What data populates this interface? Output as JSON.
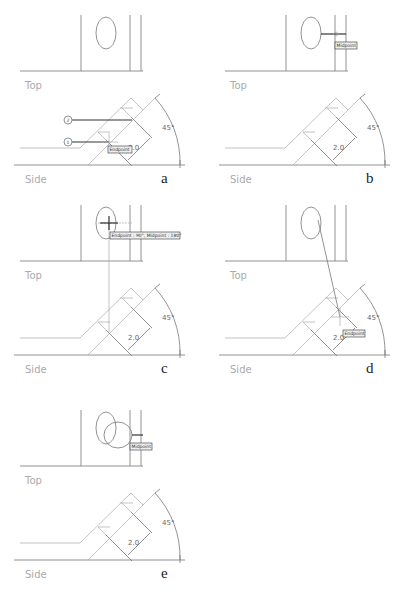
{
  "panels": [
    {
      "id": "a",
      "label": "a",
      "top_label": "Top",
      "side_label": "Side",
      "dim_length": "2.0",
      "dim_angle": "45°",
      "tooltip": "Endpoint",
      "markers": [
        "1",
        "2"
      ]
    },
    {
      "id": "b",
      "label": "b",
      "top_label": "Top",
      "side_label": "Side",
      "dim_length": "2.0",
      "dim_angle": "45°",
      "tooltip": "Midpoint"
    },
    {
      "id": "c",
      "label": "c",
      "top_label": "Top",
      "side_label": "Side",
      "dim_length": "2.0",
      "dim_angle": "45°",
      "tooltip": "Endpoint : 90°, Midpoint : 180°"
    },
    {
      "id": "d",
      "label": "d",
      "top_label": "Top",
      "side_label": "Side",
      "dim_length": "2.0",
      "dim_angle": "45°",
      "tooltip": "Endpoint"
    },
    {
      "id": "e",
      "label": "e",
      "top_label": "Top",
      "side_label": "Side",
      "dim_length": "2.0",
      "dim_angle": "45°",
      "tooltip": "Midpoint"
    }
  ],
  "colors": {
    "line": "#777777",
    "light": "#aaaaaa",
    "dark": "#333333"
  }
}
